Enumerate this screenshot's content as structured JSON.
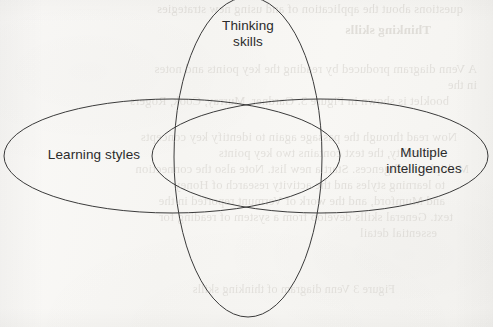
{
  "page": {
    "width": 493,
    "height": 327,
    "background_color": "#f7f6f3",
    "stroke_color": "#3b3b3b",
    "label_color": "#2b2b2b",
    "bleed_color": "#d6d3ce"
  },
  "diagram": {
    "type": "venn-diagram",
    "set_count": 3,
    "sets": [
      {
        "id": "learning-styles",
        "label": "Learning styles",
        "shape": "ellipse",
        "orientation": "horizontal",
        "cx": 172,
        "cy": 156,
        "rx": 168,
        "ry": 57,
        "label_x": 94,
        "label_y": 155
      },
      {
        "id": "multiple-intelligences",
        "label": "Multiple\nintelligences",
        "shape": "ellipse",
        "orientation": "horizontal",
        "cx": 320,
        "cy": 156,
        "rx": 168,
        "ry": 57,
        "label_x": 424,
        "label_y": 161
      },
      {
        "id": "thinking-skills",
        "label": "Thinking\nskills",
        "shape": "ellipse",
        "orientation": "vertical",
        "cx": 248,
        "cy": 157,
        "rx": 74,
        "ry": 160,
        "label_x": 248,
        "label_y": 34
      }
    ]
  },
  "bleed_through": {
    "description": "faint mirrored text showing through from the reverse side of the scanned page",
    "lines": [
      {
        "text": "questions about the application of and using new strategies",
        "x": 30,
        "y": 2,
        "size": 12.5,
        "bold": false
      },
      {
        "text": "Thinking skills",
        "x": 62,
        "y": 22,
        "size": 13,
        "bold": true
      },
      {
        "text": "A Venn diagram produced by reading the key points and notes",
        "x": 16,
        "y": 62,
        "size": 12.5,
        "bold": false
      },
      {
        "text": "in the",
        "x": 16,
        "y": 78,
        "size": 12.5,
        "bold": false
      },
      {
        "text": "booklet is shown in Figure 3. Gardner, Murray, Cook, Rogers",
        "x": 44,
        "y": 94,
        "size": 12.5,
        "bold": false
      },
      {
        "text": "Now read through the passage again to identify key concepts",
        "x": 36,
        "y": 130,
        "size": 12.5,
        "bold": false
      },
      {
        "text": "In reality, the text contains two key points",
        "x": 56,
        "y": 146,
        "size": 12.5,
        "bold": false
      },
      {
        "text": "Multiple intelligences. Start a new list. Note also the connection",
        "x": 24,
        "y": 162,
        "size": 12.5,
        "bold": false
      },
      {
        "text": "to learning styles and the activity research of Honey",
        "x": 48,
        "y": 178,
        "size": 12.5,
        "bold": false
      },
      {
        "text": "and Mumford, and the work of Vermunt reported in the",
        "x": 48,
        "y": 194,
        "size": 12.5,
        "bold": false
      },
      {
        "text": "text. General skills develop from a system of reading for",
        "x": 40,
        "y": 210,
        "size": 12.5,
        "bold": false
      },
      {
        "text": "essential detail",
        "x": 56,
        "y": 226,
        "size": 12.5,
        "bold": false
      },
      {
        "text": "Figure 3 Venn diagram of thinking skills",
        "x": 98,
        "y": 282,
        "size": 12,
        "bold": false
      }
    ]
  }
}
